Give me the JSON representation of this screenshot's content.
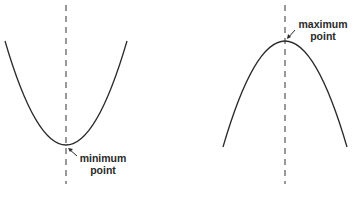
{
  "diagrams": [
    {
      "name": "upward-parabola",
      "label_line1": "minimum",
      "label_line2": "point",
      "vertex": [
        66,
        145
      ],
      "axis_x": 66
    },
    {
      "name": "downward-parabola",
      "label_line1": "maximum",
      "label_line2": "point",
      "vertex": [
        285,
        41
      ],
      "axis_x": 285
    }
  ],
  "colors": {
    "curve": "#2a2a2a",
    "axis": "#555555",
    "background": "#ffffff"
  }
}
